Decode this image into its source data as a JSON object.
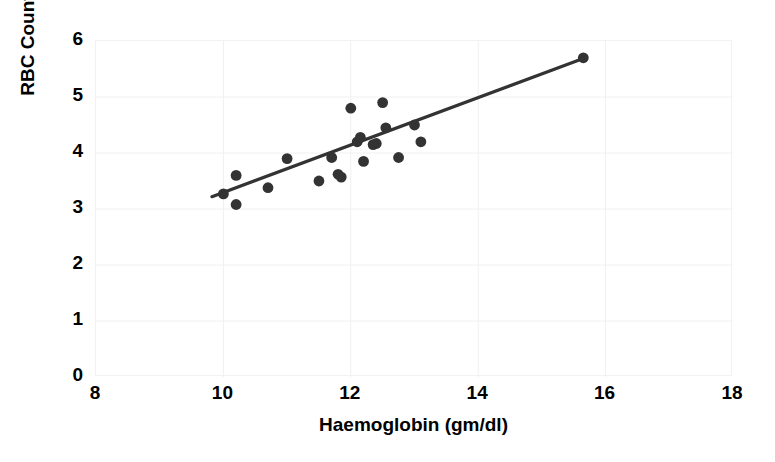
{
  "chart_data": {
    "type": "scatter",
    "title": "",
    "xlabel": "Haemoglobin (gm/dl)",
    "ylabel": "RBC Count",
    "xlim": [
      8,
      18
    ],
    "ylim": [
      0,
      6
    ],
    "xticks": [
      8,
      10,
      12,
      14,
      16,
      18
    ],
    "yticks": [
      0,
      1,
      2,
      3,
      4,
      5,
      6
    ],
    "grid": true,
    "legend": "none",
    "marker_color": "#333333",
    "trendline_color": "#333333",
    "points": [
      {
        "x": 10.0,
        "y": 3.27
      },
      {
        "x": 10.2,
        "y": 3.6
      },
      {
        "x": 10.2,
        "y": 3.08
      },
      {
        "x": 10.7,
        "y": 3.38
      },
      {
        "x": 11.0,
        "y": 3.9
      },
      {
        "x": 11.5,
        "y": 3.5
      },
      {
        "x": 11.7,
        "y": 3.92
      },
      {
        "x": 11.8,
        "y": 3.62
      },
      {
        "x": 11.85,
        "y": 3.57
      },
      {
        "x": 12.0,
        "y": 4.8
      },
      {
        "x": 12.1,
        "y": 4.2
      },
      {
        "x": 12.15,
        "y": 4.28
      },
      {
        "x": 12.2,
        "y": 3.85
      },
      {
        "x": 12.35,
        "y": 4.15
      },
      {
        "x": 12.4,
        "y": 4.17
      },
      {
        "x": 12.5,
        "y": 4.9
      },
      {
        "x": 12.55,
        "y": 4.45
      },
      {
        "x": 12.75,
        "y": 3.92
      },
      {
        "x": 13.0,
        "y": 4.5
      },
      {
        "x": 13.1,
        "y": 4.2
      },
      {
        "x": 15.65,
        "y": 5.7
      }
    ],
    "trendline": {
      "x_start": 9.82,
      "y_start": 3.22,
      "x_end": 15.68,
      "y_end": 5.7
    }
  },
  "axes": {
    "y_title": "RBC Count",
    "x_title": "Haemoglobin (gm/dl)",
    "y_tick_labels": [
      "6",
      "5",
      "4",
      "3",
      "2",
      "1",
      "0"
    ],
    "x_tick_labels": [
      "8",
      "10",
      "12",
      "14",
      "16",
      "18"
    ]
  }
}
